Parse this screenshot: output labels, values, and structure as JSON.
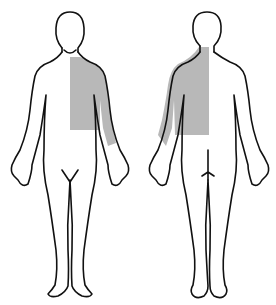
{
  "diagram": {
    "type": "body-pain-map",
    "views": [
      {
        "name": "front",
        "label": ""
      },
      {
        "name": "back",
        "label": ""
      }
    ],
    "shaded_region": {
      "description": "left side of neck, shoulder, upper chest/back and upper arm",
      "color": "#b8b8b8"
    },
    "outline_color": "#111111",
    "background": "#ffffff"
  }
}
